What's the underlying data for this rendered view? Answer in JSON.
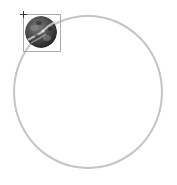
{
  "canvas": {
    "width": 177,
    "height": 185,
    "background": "#ffffff"
  },
  "orbit": {
    "shape": "circle-outline",
    "cx": 88,
    "cy": 92,
    "rx": 75,
    "ry": 77,
    "stroke": "#c4c4c4",
    "stroke_width": 2
  },
  "selected_object": {
    "type": "planet-image",
    "icon": "planet-icon",
    "cx": 41,
    "cy": 32,
    "radius": 16,
    "colors": {
      "dark": "#2e2e2e",
      "mid": "#6b6b6b",
      "light": "#c8c8c8"
    },
    "selection_box": {
      "x": 23,
      "y": 14,
      "width": 38,
      "height": 38,
      "stroke": "#a9a9a9"
    },
    "handle": {
      "icon": "crosshair-icon",
      "x": 23,
      "y": 14
    }
  }
}
